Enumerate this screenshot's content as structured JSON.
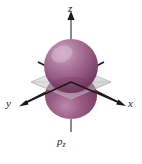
{
  "figure": {
    "name": "pz-orbital-diagram",
    "background_color": "#ffffff",
    "orbital_label": "p",
    "orbital_subscript": "z",
    "caption_fragment": "",
    "axes": {
      "z_label": "z",
      "x_label": "x",
      "y_label": "y",
      "axis_color": "#8a8a8a",
      "axis_dark_color": "#1a1a1a"
    },
    "nodal_plane": {
      "name": "xy-nodal-plane",
      "fill_color": "#d8d8d8",
      "edge_color": "#b5b5b5"
    },
    "lobes": {
      "upper": {
        "name": "upper-lobe",
        "base_color": "#9e5b85",
        "highlight_color": "#c49ab8",
        "shadow_color": "#6e3a5c"
      },
      "lower": {
        "name": "lower-lobe",
        "base_color": "#8f4f77",
        "highlight_color": "#b88aa8",
        "shadow_color": "#5e2f4d"
      }
    }
  }
}
